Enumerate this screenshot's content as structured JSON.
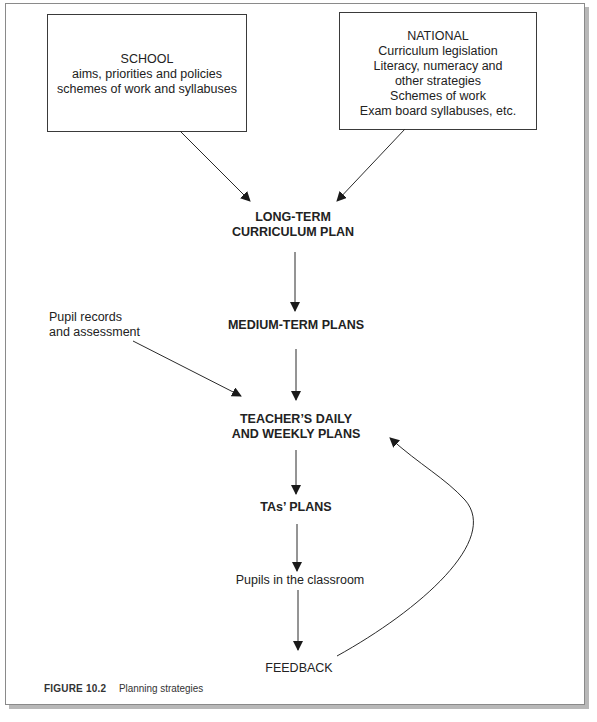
{
  "figure": {
    "number_label": "FIGURE 10.2",
    "title": "Planning strategies"
  },
  "sources": {
    "school": {
      "lines": [
        "SCHOOL",
        "aims, priorities and policies",
        "schemes of work and syllabuses"
      ]
    },
    "national": {
      "lines": [
        "NATIONAL",
        "Curriculum legislation",
        "Literacy, numeracy and",
        "other strategies",
        "Schemes of work",
        "Exam board syllabuses, etc."
      ]
    }
  },
  "flow": {
    "long_term": [
      "LONG-TERM",
      "CURRICULUM PLAN"
    ],
    "medium_term": "MEDIUM-TERM PLANS",
    "pupil_records": [
      "Pupil records",
      "and assessment"
    ],
    "teacher_plans": [
      "TEACHER’S DAILY",
      "AND WEEKLY PLANS"
    ],
    "ta_plans": "TAs’ PLANS",
    "pupils": "Pupils in the classroom",
    "feedback": "FEEDBACK"
  },
  "colors": {
    "line": "#2a2a2a",
    "border": "#3a3a3a",
    "shadow": "#b8b8b8"
  }
}
